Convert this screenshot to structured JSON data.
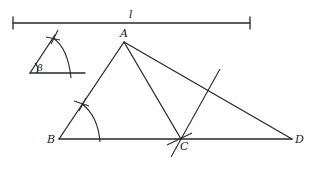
{
  "figure": {
    "type": "geometric-construction",
    "segment": {
      "label": "l",
      "x1": 13,
      "y1": 23,
      "x2": 250,
      "y2": 23
    },
    "given_angle": {
      "label": "β",
      "vertex": [
        30,
        73
      ],
      "ray_end_horizontal": [
        85,
        73
      ],
      "ray_end_slanted": [
        54,
        36
      ]
    },
    "points": {
      "A": {
        "label": "A",
        "x": 124,
        "y": 42
      },
      "B": {
        "label": "B",
        "x": 59,
        "y": 139
      },
      "C": {
        "label": "C",
        "x": 181,
        "y": 139
      },
      "D": {
        "label": "D",
        "x": 292,
        "y": 139
      }
    },
    "segments": [
      "AB",
      "AC",
      "AD",
      "BD"
    ],
    "construction_line_through_C": {
      "x1": 171,
      "y1": 157,
      "x2": 220,
      "y2": 69
    }
  },
  "labels": {
    "segment": "l",
    "angle": "β",
    "A": "A",
    "B": "B",
    "C": "C",
    "D": "D"
  }
}
